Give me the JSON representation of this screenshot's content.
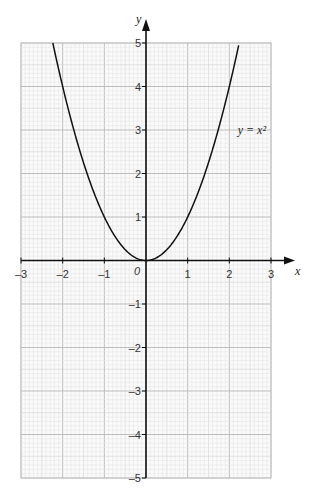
{
  "chart_data": {
    "type": "line",
    "title": "",
    "xlabel": "x",
    "ylabel": "y",
    "xlim": [
      -3,
      3
    ],
    "ylim": [
      -5,
      5
    ],
    "x_ticks": [
      "-3",
      "-2",
      "-1",
      "0",
      "1",
      "2",
      "3"
    ],
    "y_ticks": [
      "-5",
      "-4",
      "-3",
      "-2",
      "-1",
      "1",
      "2",
      "3",
      "4",
      "5"
    ],
    "origin_label": "0",
    "grid": true,
    "series": [
      {
        "name": "y = x²",
        "function": "x^2",
        "x": [
          -2.24,
          -2,
          -1.5,
          -1,
          -0.5,
          0,
          0.5,
          1,
          1.5,
          2,
          2.24
        ],
        "y": [
          5,
          4,
          2.25,
          1,
          0.25,
          0,
          0.25,
          1,
          2.25,
          4,
          5
        ]
      }
    ],
    "annotations": [
      {
        "text": "y = x²",
        "x": 2.2,
        "y": 3
      }
    ]
  },
  "labels": {
    "x_axis": "x",
    "y_axis": "y",
    "curve": "y = x²",
    "origin": "0"
  }
}
